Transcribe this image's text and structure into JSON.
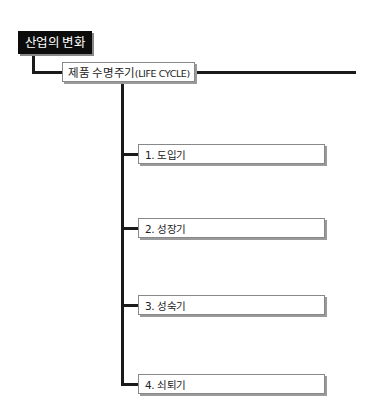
{
  "diagram": {
    "root": {
      "label": "산업의 변화"
    },
    "main": {
      "label": "제품 수명주기",
      "sublabel": "(LIFE CYCLE)"
    },
    "stages": [
      {
        "label": "1. 도입기"
      },
      {
        "label": "2. 성장기"
      },
      {
        "label": "3. 성숙기"
      },
      {
        "label": "4. 쇠퇴기"
      }
    ],
    "colors": {
      "root_bg": "#0c0c0c",
      "line": "#1a1a1a",
      "box_border": "#888888"
    }
  }
}
